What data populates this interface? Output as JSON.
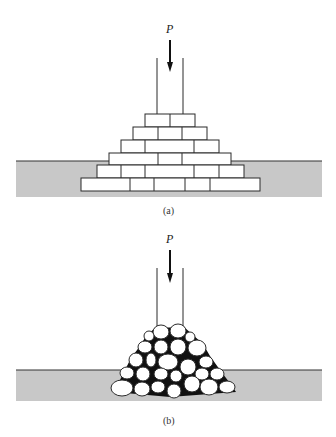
{
  "colors": {
    "ground": "#c8c8c8",
    "ground_line": "#333333",
    "outline": "#2a2a2a",
    "void": "#111111",
    "fill": "#ffffff"
  },
  "diagram_a": {
    "load_label": "P",
    "caption": "(a)",
    "description": "Load P applied through a column onto a stepped pyramid of rectangular blocks embedded in ground",
    "ground": {
      "x": 16,
      "y": 161,
      "w": 306,
      "h": 36
    },
    "column": {
      "x_left": 157,
      "x_right": 183,
      "y_top": 58,
      "y_bottom": 114
    },
    "arrow": {
      "x": 170,
      "y_top": 40,
      "y_tip": 72
    },
    "brick_rows": [
      {
        "y": 114,
        "h": 13,
        "x0": 145,
        "x1": 195,
        "dividers": [
          170
        ]
      },
      {
        "y": 127,
        "h": 13,
        "x0": 133,
        "x1": 207,
        "dividers": [
          158,
          182
        ]
      },
      {
        "y": 140,
        "h": 13,
        "x0": 121,
        "x1": 219,
        "dividers": [
          145,
          194
        ]
      },
      {
        "y": 153,
        "h": 12,
        "x0": 109,
        "x1": 231,
        "dividers": [
          158,
          182
        ]
      },
      {
        "y": 165,
        "h": 13,
        "x0": 97,
        "x1": 244,
        "dividers": [
          121,
          145,
          194,
          219
        ]
      },
      {
        "y": 178,
        "h": 13,
        "x0": 81,
        "x1": 260,
        "dividers": [
          130,
          154,
          185,
          210
        ]
      }
    ]
  },
  "diagram_b": {
    "load_label": "P",
    "caption": "(b)",
    "description": "Load P applied through a column onto a pile of rounded particles embedded in ground",
    "ground": {
      "x": 16,
      "y": 370,
      "w": 306,
      "h": 31
    },
    "column": {
      "x_left": 157,
      "x_right": 183,
      "y_top": 268,
      "y_bottom": 326
    },
    "arrow": {
      "x": 170,
      "y_top": 250,
      "y_tip": 283
    },
    "particles": [
      {
        "cx": 161,
        "cy": 332,
        "rx": 8,
        "ry": 7
      },
      {
        "cx": 178,
        "cy": 331,
        "rx": 8,
        "ry": 7
      },
      {
        "cx": 149,
        "cy": 336,
        "rx": 5,
        "ry": 5
      },
      {
        "cx": 190,
        "cy": 337,
        "rx": 5,
        "ry": 5
      },
      {
        "cx": 145,
        "cy": 347,
        "rx": 7,
        "ry": 6
      },
      {
        "cx": 161,
        "cy": 347,
        "rx": 7,
        "ry": 7
      },
      {
        "cx": 178,
        "cy": 347,
        "rx": 8,
        "ry": 8
      },
      {
        "cx": 197,
        "cy": 348,
        "rx": 9,
        "ry": 8
      },
      {
        "cx": 136,
        "cy": 360,
        "rx": 7,
        "ry": 7
      },
      {
        "cx": 151,
        "cy": 360,
        "rx": 5,
        "ry": 7
      },
      {
        "cx": 168,
        "cy": 362,
        "rx": 10,
        "ry": 8
      },
      {
        "cx": 188,
        "cy": 367,
        "rx": 8,
        "ry": 8
      },
      {
        "cx": 206,
        "cy": 362,
        "rx": 7,
        "ry": 6
      },
      {
        "cx": 127,
        "cy": 373,
        "rx": 7,
        "ry": 6
      },
      {
        "cx": 143,
        "cy": 374,
        "rx": 7,
        "ry": 7
      },
      {
        "cx": 161,
        "cy": 374,
        "rx": 7,
        "ry": 6
      },
      {
        "cx": 176,
        "cy": 376,
        "rx": 6,
        "ry": 6
      },
      {
        "cx": 202,
        "cy": 374,
        "rx": 7,
        "ry": 6
      },
      {
        "cx": 217,
        "cy": 374,
        "rx": 7,
        "ry": 6
      },
      {
        "cx": 122,
        "cy": 388,
        "rx": 11,
        "ry": 8
      },
      {
        "cx": 142,
        "cy": 389,
        "rx": 8,
        "ry": 7
      },
      {
        "cx": 158,
        "cy": 387,
        "rx": 7,
        "ry": 6
      },
      {
        "cx": 174,
        "cy": 391,
        "rx": 7,
        "ry": 7
      },
      {
        "cx": 192,
        "cy": 384,
        "rx": 8,
        "ry": 8
      },
      {
        "cx": 209,
        "cy": 387,
        "rx": 9,
        "ry": 8
      },
      {
        "cx": 227,
        "cy": 387,
        "rx": 8,
        "ry": 6
      }
    ]
  }
}
